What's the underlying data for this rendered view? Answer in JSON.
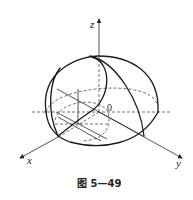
{
  "figure": {
    "caption": "图 5—49",
    "axes": {
      "x_label": "x",
      "y_label": "y",
      "z_label": "z",
      "origin_label": "0"
    }
  }
}
